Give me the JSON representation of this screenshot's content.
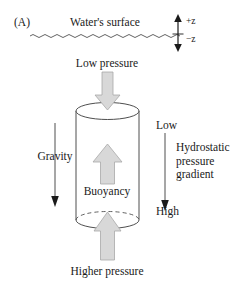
{
  "figure": {
    "panel_label": "(A)",
    "title": "Water's surface",
    "axis_up_label": "+z",
    "axis_down_label": "−z",
    "top_pressure_label": "Low pressure",
    "bottom_pressure_label": "Higher pressure",
    "buoyancy_label": "Buoyancy",
    "gravity_label": "Gravity",
    "gradient_top_label": "Low",
    "gradient_bottom_label": "High",
    "gradient_label": "Hydrostatic pressure gradient"
  },
  "icons": {
    "water_surface": "wavy-line-icon",
    "axis": "double-headed-vertical-arrow-icon",
    "top_arrow": "block-arrow-down-icon",
    "buoyancy_arrow": "block-arrow-up-icon",
    "bottom_arrow": "block-arrow-up-icon",
    "gravity_arrow": "thin-arrow-down-icon",
    "gradient_arrow": "thin-arrow-down-icon",
    "cylinder": "cylinder-shape-icon"
  },
  "colors": {
    "stroke": "#3a3a3a",
    "block_arrow_fill": "#d8d8d8",
    "block_arrow_stroke": "#a8a8a8",
    "text": "#1a1a1a",
    "background": "#ffffff"
  }
}
